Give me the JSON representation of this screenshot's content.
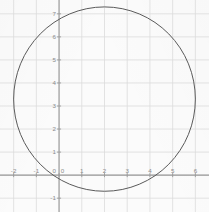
{
  "chart_data": {
    "type": "scatter",
    "title": "",
    "xlabel": "",
    "ylabel": "",
    "grid": true,
    "legend": null,
    "xlim": [
      -2.6,
      6.6
    ],
    "ylim": [
      -1.6,
      7.6
    ],
    "x_ticks": [
      -2,
      -1,
      0,
      1,
      2,
      3,
      4,
      5,
      6
    ],
    "y_ticks": [
      -1,
      0,
      1,
      2,
      3,
      4,
      5,
      6,
      7
    ],
    "x_tick_labels": [
      "-2",
      "-1",
      "0",
      "1",
      "2",
      "3",
      "4",
      "5",
      "6"
    ],
    "y_tick_labels": [
      "-1",
      "0",
      "1",
      "2",
      "3",
      "4",
      "5",
      "6",
      "7"
    ],
    "series": [
      {
        "name": "circle",
        "type": "circle",
        "center_x": 2,
        "center_y": 3.3,
        "radius": 4,
        "stroke": "#5a5a5a",
        "fill": "none"
      }
    ]
  },
  "style": {
    "background": "#fbfbfb",
    "grid_color": "#dcdcdc",
    "axis_color": "#9a9a9a",
    "curve_color": "#595959",
    "tick_text_color": "#8a8a8a"
  }
}
